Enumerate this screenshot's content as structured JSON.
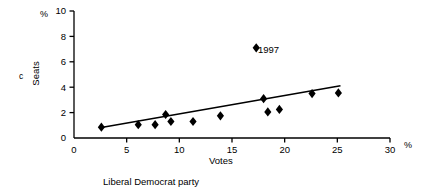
{
  "chart_data": {
    "type": "scatter",
    "title": "",
    "caption": "Liberal Democrat party",
    "xlabel": "Votes",
    "ylabel": "Seats",
    "x_unit_symbol": "%",
    "y_unit_symbol": "%",
    "corner_letter": "c",
    "xlim": [
      0,
      30
    ],
    "ylim": [
      0,
      10
    ],
    "xticks": [
      0,
      5,
      10,
      15,
      20,
      25,
      30
    ],
    "yticks": [
      0,
      2,
      4,
      6,
      8,
      10
    ],
    "xtick_labels": [
      "0",
      "5",
      "10",
      "15",
      "20",
      "25",
      "30"
    ],
    "ytick_labels": [
      "0",
      "2",
      "4",
      "6",
      "8",
      "10"
    ],
    "grid": false,
    "legend": false,
    "marker": "diamond",
    "marker_color": "#000000",
    "line_color": "#000000",
    "points": [
      {
        "x": 2.6,
        "y": 0.85
      },
      {
        "x": 6.1,
        "y": 1.05
      },
      {
        "x": 7.7,
        "y": 1.05
      },
      {
        "x": 8.7,
        "y": 1.85
      },
      {
        "x": 9.2,
        "y": 1.3
      },
      {
        "x": 11.3,
        "y": 1.3
      },
      {
        "x": 13.9,
        "y": 1.75
      },
      {
        "x": 18.0,
        "y": 3.1
      },
      {
        "x": 18.4,
        "y": 2.05
      },
      {
        "x": 19.5,
        "y": 2.25
      },
      {
        "x": 22.6,
        "y": 3.5
      },
      {
        "x": 25.1,
        "y": 3.55
      }
    ],
    "trendline": {
      "x0": 2.6,
      "y0": 0.82,
      "x1": 25.3,
      "y1": 4.12
    },
    "annotations": [
      {
        "label": "1997",
        "marker_x": 17.3,
        "marker_y": 7.1,
        "marker": "diamond"
      }
    ]
  }
}
